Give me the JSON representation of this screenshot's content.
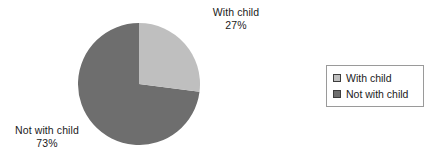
{
  "chart_data": {
    "type": "pie",
    "title": "",
    "categories": [
      "With child",
      "Not with child"
    ],
    "values": [
      27,
      73
    ],
    "value_unit": "%",
    "data_labels": [
      {
        "name": "With child",
        "percent_text": "27%",
        "percent": 27
      },
      {
        "name": "Not with child",
        "percent_text": "73%",
        "percent": 73
      }
    ],
    "legend": {
      "position": "right",
      "entries": [
        {
          "label": "With child",
          "color": "#bfbfbf"
        },
        {
          "label": "Not with child",
          "color": "#6e6e6e"
        }
      ]
    },
    "colors": [
      "#bfbfbf",
      "#6e6e6e"
    ],
    "start_angle_deg": 0,
    "direction": "clockwise",
    "xlabel": "",
    "ylabel": "",
    "grid": false
  },
  "labels": {
    "with_child": {
      "name": "With child",
      "percent": "27%"
    },
    "not_with_child": {
      "name": "Not with child",
      "percent": "73%"
    }
  },
  "legend": {
    "items": [
      {
        "label": "With child"
      },
      {
        "label": "Not with child"
      }
    ]
  },
  "colors": {
    "slice_with_child": "#bfbfbf",
    "slice_not_with_child": "#6e6e6e",
    "legend_border": "#9a9a9a",
    "swatch_border": "#3d3d3d",
    "text": "#1b1b1b",
    "background": "#ffffff"
  }
}
